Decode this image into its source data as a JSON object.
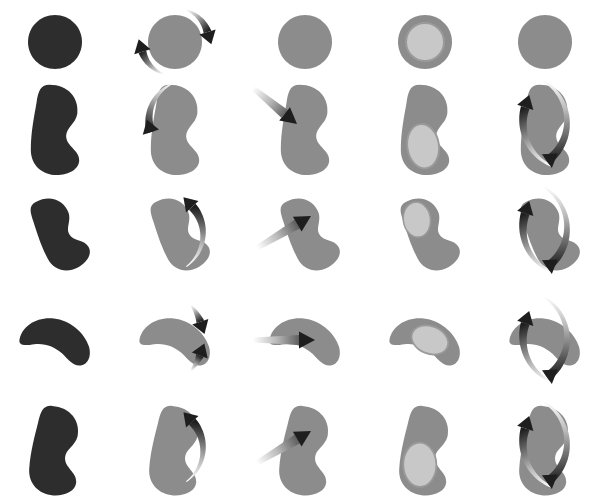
{
  "figure": {
    "type": "stimulus-grid",
    "title": "",
    "background_color": "#ffffff",
    "rows": 5,
    "columns": 5,
    "cell_width": 120,
    "cell_height": 99,
    "canvas": {
      "width": 602,
      "height": 495
    }
  },
  "colors": {
    "dark_shape": "#2e2d2d",
    "gray_shape": "#8c8c8c",
    "gray_shape_outline": "#8a8a8a",
    "inner_marker": "#c8c8c8",
    "inner_marker_outline": "#9a9a9a",
    "arrow_dark": "#1e1e1e",
    "arrow_fade": "#ffffff"
  },
  "columns": [
    {
      "index": 1,
      "name": "silhouette",
      "label": "silhouette",
      "shape_color": "#2e2d2d",
      "has_arrow": false,
      "arrow_kind": "none",
      "has_inner_marker": false
    },
    {
      "index": 2,
      "name": "curved-arrow",
      "label": "curved rotation arrow",
      "shape_color": "#8c8c8c",
      "has_arrow": true,
      "arrow_kind": "curved",
      "has_inner_marker": false
    },
    {
      "index": 3,
      "name": "straight-arrow",
      "label": "straight motion arrow",
      "shape_color": "#8c8c8c",
      "has_arrow": true,
      "arrow_kind": "straight",
      "has_inner_marker": false
    },
    {
      "index": 4,
      "name": "inner-marker",
      "label": "inner ellipse marker",
      "shape_color": "#8c8c8c",
      "has_arrow": false,
      "arrow_kind": "none",
      "has_inner_marker": true
    },
    {
      "index": 5,
      "name": "double-curved-arrow",
      "label": "double curved arrows",
      "shape_color": "#8c8c8c",
      "has_arrow": true,
      "arrow_kind": "curved-double",
      "has_inner_marker": false
    }
  ],
  "rows": [
    {
      "index": 1,
      "name": "circle",
      "label": "circle / unbent",
      "bend": 0,
      "rotation": 0
    },
    {
      "index": 2,
      "name": "bean-upright",
      "label": "bean upright",
      "bend": 35,
      "rotation": 0
    },
    {
      "index": 3,
      "name": "bean-tilted",
      "label": "bean tilted",
      "bend": 45,
      "rotation": -25
    },
    {
      "index": 4,
      "name": "crescent",
      "label": "crescent",
      "bend": 70,
      "rotation": -80
    },
    {
      "index": 5,
      "name": "bean-upright-2",
      "label": "bean upright variant",
      "bend": 40,
      "rotation": 5
    }
  ],
  "cells": [
    {
      "row": 1,
      "col": 1,
      "name": "cell-r1c1",
      "shape": "circle",
      "arrow": "none"
    },
    {
      "row": 1,
      "col": 2,
      "name": "cell-r1c2",
      "shape": "circle",
      "arrow": "curved-pair-around-circle"
    },
    {
      "row": 1,
      "col": 3,
      "name": "cell-r1c3",
      "shape": "circle",
      "arrow": "none"
    },
    {
      "row": 1,
      "col": 4,
      "name": "cell-r1c4",
      "shape": "circle",
      "arrow": "none"
    },
    {
      "row": 1,
      "col": 5,
      "name": "cell-r1c5",
      "shape": "circle",
      "arrow": "none"
    },
    {
      "row": 2,
      "col": 1,
      "name": "cell-r2c1",
      "shape": "bean",
      "arrow": "none"
    },
    {
      "row": 2,
      "col": 2,
      "name": "cell-r2c2",
      "shape": "bean",
      "arrow": "curved-left-down"
    },
    {
      "row": 2,
      "col": 3,
      "name": "cell-r2c3",
      "shape": "bean",
      "arrow": "straight-down-right"
    },
    {
      "row": 2,
      "col": 4,
      "name": "cell-r2c4",
      "shape": "bean",
      "arrow": "none"
    },
    {
      "row": 2,
      "col": 5,
      "name": "cell-r2c5",
      "shape": "bean",
      "arrow": "curved-double-lr"
    },
    {
      "row": 3,
      "col": 1,
      "name": "cell-r3c1",
      "shape": "bean-tilted",
      "arrow": "none"
    },
    {
      "row": 3,
      "col": 2,
      "name": "cell-r3c2",
      "shape": "bean-tilted",
      "arrow": "curved-up-right"
    },
    {
      "row": 3,
      "col": 3,
      "name": "cell-r3c3",
      "shape": "bean-tilted",
      "arrow": "straight-up-right"
    },
    {
      "row": 3,
      "col": 4,
      "name": "cell-r3c4",
      "shape": "bean-tilted",
      "arrow": "none"
    },
    {
      "row": 3,
      "col": 5,
      "name": "cell-r3c5",
      "shape": "bean-tilted",
      "arrow": "curved-double-lr"
    },
    {
      "row": 4,
      "col": 1,
      "name": "cell-r4c1",
      "shape": "crescent",
      "arrow": "none"
    },
    {
      "row": 4,
      "col": 2,
      "name": "cell-r4c2",
      "shape": "crescent",
      "arrow": "two-small-arrows-right"
    },
    {
      "row": 4,
      "col": 3,
      "name": "cell-r4c3",
      "shape": "crescent",
      "arrow": "straight-right"
    },
    {
      "row": 4,
      "col": 4,
      "name": "cell-r4c4",
      "shape": "crescent",
      "arrow": "none"
    },
    {
      "row": 4,
      "col": 5,
      "name": "cell-r4c5",
      "shape": "crescent",
      "arrow": "curved-double-lr"
    },
    {
      "row": 5,
      "col": 1,
      "name": "cell-r5c1",
      "shape": "bean",
      "arrow": "none"
    },
    {
      "row": 5,
      "col": 2,
      "name": "cell-r5c2",
      "shape": "bean",
      "arrow": "curved-up-right"
    },
    {
      "row": 5,
      "col": 3,
      "name": "cell-r5c3",
      "shape": "bean",
      "arrow": "straight-up-right"
    },
    {
      "row": 5,
      "col": 4,
      "name": "cell-r5c4",
      "shape": "bean",
      "arrow": "none"
    },
    {
      "row": 5,
      "col": 5,
      "name": "cell-r5c5",
      "shape": "bean",
      "arrow": "curved-double-lr"
    }
  ]
}
